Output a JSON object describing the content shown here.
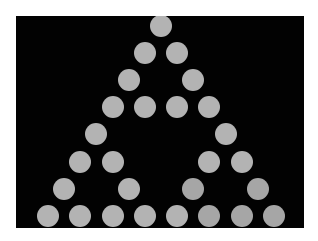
{
  "figure": {
    "background_color": "#020202",
    "page_color": "#ffffff",
    "dot_color": "#b3b3b3",
    "dot_color_dark": "#a6a6a6",
    "dot_diameter": 22,
    "panel": {
      "left": 16,
      "top": 16,
      "width": 288,
      "height": 212
    },
    "apex_x": 161,
    "first_row_y": 26,
    "row_spacing": 27.1,
    "col_spacing": 32.3,
    "rows": [
      [
        1
      ],
      [
        1,
        1
      ],
      [
        1,
        0,
        1
      ],
      [
        1,
        1,
        1,
        1
      ],
      [
        1,
        0,
        0,
        0,
        1
      ],
      [
        1,
        1,
        0,
        0,
        1,
        1
      ],
      [
        1,
        0,
        1,
        0,
        1,
        0,
        1
      ],
      [
        1,
        1,
        1,
        1,
        1,
        1,
        1,
        1
      ]
    ]
  }
}
